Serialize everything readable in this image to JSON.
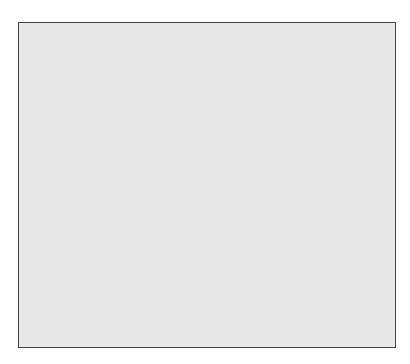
{
  "chart_data": {
    "type": "scatter",
    "title": "",
    "yscale": "log",
    "ylim": [
      1,
      300
    ],
    "left_axis": {
      "label": "(mIU/mL)",
      "ticks": [
        "1",
        "10",
        "100"
      ]
    },
    "right_axis": {
      "label": "(pg/mL)",
      "ticks": [
        "1",
        "10",
        "100"
      ]
    },
    "categories": [
      "Hypogonadotropic hypogonadism",
      "Gonadal failure"
    ],
    "panels": [
      {
        "name": "FSH",
        "series": [
          {
            "name": "Hypogonadotropic hypogonadism",
            "values": [
              7,
              5.5,
              3.8,
              3.6,
              2.4,
              1.35,
              1.2,
              1.2,
              1.2,
              1.0,
              1.0,
              1.0
            ]
          },
          {
            "name": "Gonadal failure",
            "values": [
              160,
              95,
              85,
              78,
              62,
              58,
              56,
              54,
              54,
              53,
              52,
              50,
              48,
              46,
              44,
              28,
              23
            ]
          }
        ]
      },
      {
        "name": "LH",
        "series": [
          {
            "name": "Hypogonadotropic hypogonadism",
            "values": [
              15,
              9,
              7,
              5.5,
              4,
              3.7,
              3.5,
              3.4,
              2.2,
              1.9,
              1.7,
              1.15
            ]
          },
          {
            "name": "Gonadal failure",
            "values": [
              125,
              70,
              60,
              52,
              47,
              43,
              39,
              35,
              33,
              33,
              33,
              28,
              26,
              22,
              20,
              19,
              19
            ]
          }
        ]
      },
      {
        "name": "Estradiol-17β",
        "series": [
          {
            "name": "Hypogonadotropic hypogonadism",
            "values": [
              15,
              15,
              14,
              13,
              11,
              9,
              8,
              7,
              7,
              7,
              7,
              5
            ]
          },
          {
            "name": "Gonadal failure",
            "values": [
              22,
              21,
              20,
              15,
              13,
              10,
              10,
              9,
              9,
              8,
              6.5,
              5,
              5
            ]
          }
        ]
      }
    ]
  },
  "labels": {
    "panel1": "FSH",
    "panel2": "LH",
    "panel3": "Estradiol-17β",
    "left_unit": "(mIU/mL)",
    "right_unit": "(pg/mL)",
    "cat1a": "Hypogonadotropic",
    "cat1b": "hypogonadism",
    "cat2": "Gonadal failure",
    "t1": "1",
    "t10": "10",
    "t100": "100"
  }
}
